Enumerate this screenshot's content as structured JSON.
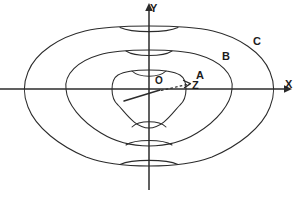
{
  "figure": {
    "kind": "contour-diagram",
    "background_color": "#ffffff",
    "stroke_color": "#2b2b2b",
    "width": 300,
    "height": 198,
    "axes": {
      "x_label": "X",
      "y_label": "Y",
      "origin_label": "O",
      "x_axis_y": 89,
      "y_axis_x": 149,
      "x_axis_start": 0,
      "x_axis_end": 290,
      "y_axis_top": 5,
      "y_axis_bottom": 190,
      "arrowheads": [
        "x-right",
        "y-up"
      ]
    },
    "vector": {
      "label": "Z",
      "style": "dashed-arrow",
      "from_x": 160,
      "from_y": 90,
      "to_x": 190,
      "to_y": 83
    },
    "ray": {
      "style": "solid-segment",
      "from_x": 124,
      "from_y": 101,
      "to_x": 160,
      "to_y": 90
    },
    "contours": [
      {
        "label": "A",
        "rank": 1,
        "role": "innermost",
        "left_x": 88,
        "right_x": 186,
        "top_y": 70,
        "bottom_y": 128,
        "waist_top_y": 77,
        "waist_bottom_y": 121
      },
      {
        "label": "B",
        "rank": 2,
        "role": "middle",
        "left_x": 57,
        "right_x": 233,
        "top_y": 50,
        "bottom_y": 146,
        "waist_top_y": 58,
        "waist_bottom_y": 139
      },
      {
        "label": "C",
        "rank": 3,
        "role": "outermost",
        "left_x": 22,
        "right_x": 272,
        "top_y": 26,
        "bottom_y": 166,
        "waist_top_y": 33,
        "waist_bottom_y": 159
      }
    ],
    "caption_fragment": ""
  }
}
